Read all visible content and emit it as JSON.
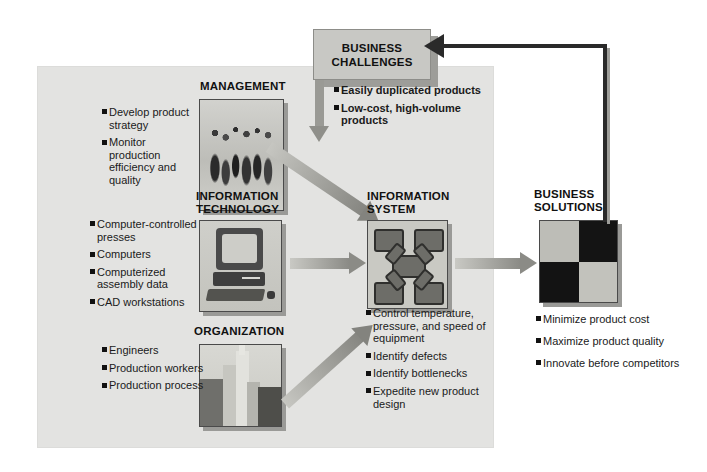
{
  "diagram": {
    "title_box": {
      "label": "BUSINESS\nCHALLENGES",
      "name": "business-challenges"
    },
    "challenges": {
      "items": [
        "Easily duplicated products",
        "Low-cost, high-volume products"
      ]
    },
    "dimensions": [
      {
        "id": "management",
        "heading": "MANAGEMENT",
        "icon": "people-photo",
        "items": [
          "Develop product strategy",
          "Monitor production efficiency and quality"
        ]
      },
      {
        "id": "information-technology",
        "heading": "INFORMATION\nTECHNOLOGY",
        "icon": "desktop-computer-photo",
        "items": [
          "Computer-controlled presses",
          "Computers",
          "Computerized assembly data",
          "CAD workstations"
        ]
      },
      {
        "id": "organization",
        "heading": "ORGANIZATION",
        "icon": "city-buildings-photo",
        "items": [
          "Engineers",
          "Production workers",
          "Production process"
        ]
      }
    ],
    "information_system": {
      "heading": "INFORMATION\nSYSTEM",
      "icon": "network-nodes-photo",
      "items": [
        "Control temperature, pressure, and speed of equipment",
        "Identify defects",
        "Identify bottlenecks",
        "Expedite new product design"
      ]
    },
    "business_solutions": {
      "heading": "BUSINESS\nSOLUTIONS",
      "icon": "four-quadrant-photo",
      "items": [
        "Minimize product cost",
        "Maximize product quality",
        "Innovate before competitors"
      ]
    },
    "colors": {
      "panel": "#e3e3e1",
      "challenge_box": "#c8c8c4",
      "arrow_gray": "#8b8b86",
      "feedback_line": "#2a2a2a",
      "text": "#111111"
    }
  }
}
